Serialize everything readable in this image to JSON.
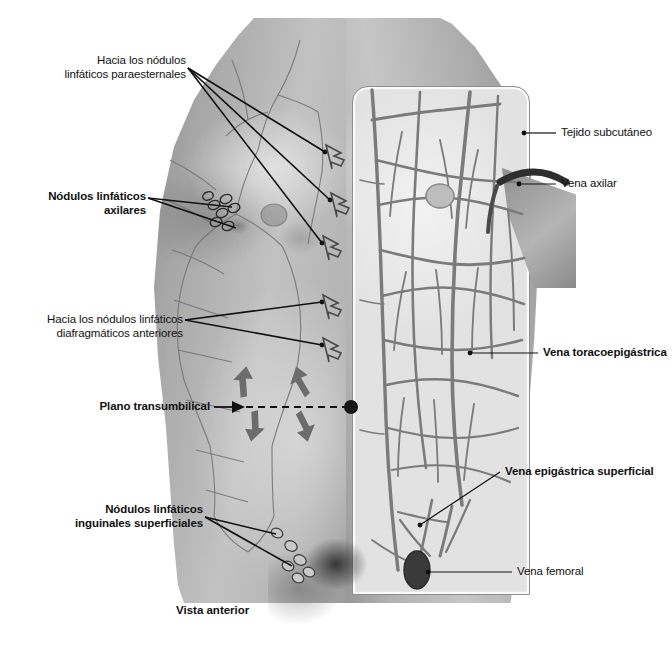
{
  "figure": {
    "caption": "Vista anterior",
    "background_color": "#ffffff",
    "ink_color": "#111111"
  },
  "labels_left": [
    {
      "id": "paraesternal",
      "text": "Hacia los nódulos\nlinfáticos paraesternales",
      "bold": false,
      "align": "right"
    },
    {
      "id": "axilares",
      "text": "Nódulos linfáticos axilares",
      "bold": true,
      "align": "right"
    },
    {
      "id": "diafragmaticos",
      "text": "Hacia los nódulos linfáticos\ndiafragmáticos anteriores",
      "bold": false,
      "align": "right"
    },
    {
      "id": "plano",
      "text": "Plano transumbilical",
      "bold": true,
      "align": "right"
    },
    {
      "id": "inguinales",
      "text": "Nódulos linfáticos\ninguinales superficiales",
      "bold": true,
      "align": "right"
    }
  ],
  "labels_right": [
    {
      "id": "tejido",
      "text": "Tejido subcutáneo",
      "bold": false,
      "align": "left"
    },
    {
      "id": "vena-axilar",
      "text": "Vena axilar",
      "bold": false,
      "align": "left"
    },
    {
      "id": "toracoepigastrica",
      "text": "Vena toracoepigástrica",
      "bold": true,
      "align": "left"
    },
    {
      "id": "epigastrica",
      "text": "Vena epigástrica superficial",
      "bold": true,
      "align": "left"
    },
    {
      "id": "femoral",
      "text": "Vena femoral",
      "bold": false,
      "align": "left"
    }
  ],
  "flow_arrows": {
    "description": "Flechas de drenaje linfático alrededor del plano transumbilical",
    "count": 4,
    "directions": [
      "arriba-izquierda",
      "arriba-derecha",
      "abajo-izquierda",
      "abajo-derecha"
    ]
  },
  "hollow_arrows": {
    "description": "Flechas huecas hacia la línea media (drenaje paraesternal y diafragmático)",
    "count": 5
  }
}
